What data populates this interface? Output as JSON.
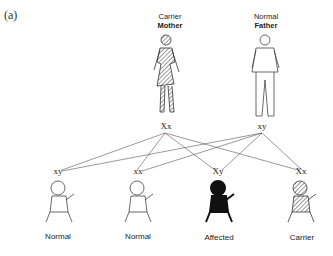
{
  "panel": {
    "label": "(a)"
  },
  "parents": [
    {
      "status": "Carrier",
      "role": "Mother",
      "genotype": "Xx",
      "fill": "hatched"
    },
    {
      "status": "Normal",
      "role": "Father",
      "genotype": "xy",
      "fill": "outline"
    }
  ],
  "children": [
    {
      "genotype": "xy",
      "label": "Normal",
      "fill": "outline"
    },
    {
      "genotype": "xx",
      "label": "Normal",
      "fill": "outline"
    },
    {
      "genotype": "Xy",
      "label": "Affected",
      "fill": "solid"
    },
    {
      "genotype": "Xx",
      "label": "Carrier",
      "fill": "hatched"
    }
  ],
  "colors": {
    "line": "#555555",
    "solid": "#111111",
    "outline": "#444444"
  }
}
